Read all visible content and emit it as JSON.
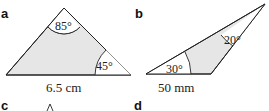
{
  "figures": [
    {
      "label": "a",
      "angles": {
        "top": "85°",
        "bottom_right": "45°"
      },
      "side": "6.5 cm"
    },
    {
      "label": "b",
      "angles": {
        "left": "30°",
        "top_right": "20°"
      },
      "side": "50 mm"
    },
    {
      "label": "c"
    },
    {
      "label": "d"
    }
  ],
  "colors": {
    "fill": "#e6e6e6",
    "stroke": "#222222"
  }
}
